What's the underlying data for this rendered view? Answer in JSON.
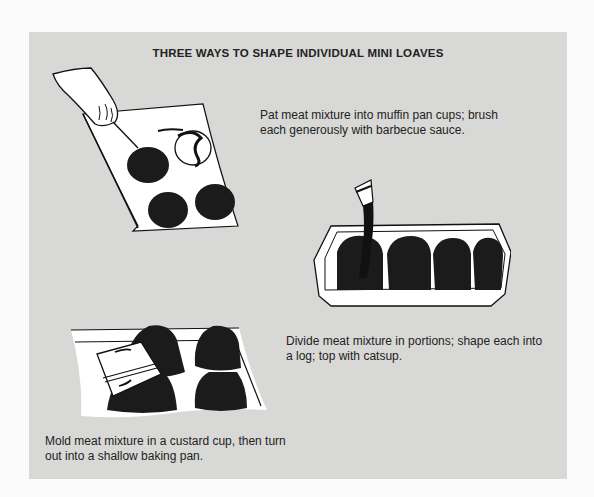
{
  "page": {
    "title": "THREE WAYS TO SHAPE INDIVIDUAL MINI LOAVES",
    "background_color": "#d8d8d6",
    "surround_color": "#fbfbfb"
  },
  "methods": [
    {
      "id": "muffin-pan",
      "illustration": "hand-pressing-meat-into-muffin-pan-icon",
      "caption_lines": [
        "Pat meat mixture into muffin pan cups; brush",
        "each generously with barbecue sauce."
      ]
    },
    {
      "id": "loaf-pan-logs",
      "illustration": "brush-topping-logs-in-baking-dish-icon",
      "caption_lines": [
        "Divide meat mixture in portions; shape each into",
        "a log; top with catsup."
      ]
    },
    {
      "id": "custard-cup",
      "illustration": "custard-cup-unmolding-onto-pan-icon",
      "caption_lines": [
        "Mold meat mixture in a custard cup, then turn",
        "out into a shallow baking pan."
      ]
    }
  ]
}
